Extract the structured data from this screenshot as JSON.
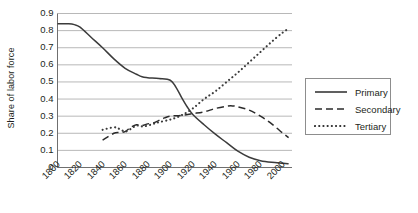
{
  "chart_data": {
    "type": "line",
    "title": "",
    "xlabel": "",
    "ylabel": "Share of labor force",
    "xlim": [
      1800,
      2008
    ],
    "ylim": [
      0,
      0.9
    ],
    "grid": true,
    "legend_position": "right",
    "y_ticks": [
      "0",
      "0.1",
      "0.2",
      "0.3",
      "0.4",
      "0.5",
      "0.6",
      "0.7",
      "0.8",
      "0.9"
    ],
    "y_tick_values": [
      0,
      0.1,
      0.2,
      0.3,
      0.4,
      0.5,
      0.6,
      0.7,
      0.8,
      0.9
    ],
    "x_ticks": [
      "1800",
      "1820",
      "1840",
      "1860",
      "1880",
      "1900",
      "1920",
      "1940",
      "1960",
      "1980",
      "2000"
    ],
    "x_tick_values": [
      1800,
      1820,
      1840,
      1860,
      1880,
      1900,
      1920,
      1940,
      1960,
      1980,
      2000
    ],
    "series": [
      {
        "name": "Primary",
        "style": "solid",
        "color": "#3b3b3b",
        "x": [
          1800,
          1810,
          1815,
          1820,
          1830,
          1840,
          1850,
          1860,
          1870,
          1875,
          1880,
          1890,
          1900,
          1905,
          1910,
          1915,
          1920,
          1930,
          1940,
          1950,
          1960,
          1970,
          1980,
          1990,
          2000,
          2005
        ],
        "values": [
          0.84,
          0.84,
          0.835,
          0.82,
          0.76,
          0.7,
          0.635,
          0.58,
          0.545,
          0.53,
          0.525,
          0.52,
          0.51,
          0.47,
          0.41,
          0.355,
          0.31,
          0.25,
          0.195,
          0.145,
          0.095,
          0.06,
          0.04,
          0.03,
          0.025,
          0.022
        ]
      },
      {
        "name": "Secondary",
        "style": "dashed",
        "color": "#2b2b2b",
        "x": [
          1840,
          1850,
          1855,
          1860,
          1865,
          1870,
          1875,
          1880,
          1885,
          1890,
          1895,
          1900,
          1910,
          1920,
          1930,
          1940,
          1950,
          1955,
          1960,
          1970,
          1980,
          1990,
          2000,
          2005
        ],
        "values": [
          0.16,
          0.2,
          0.205,
          0.21,
          0.235,
          0.25,
          0.245,
          0.255,
          0.26,
          0.275,
          0.29,
          0.3,
          0.305,
          0.315,
          0.325,
          0.345,
          0.358,
          0.36,
          0.355,
          0.335,
          0.3,
          0.255,
          0.2,
          0.175
        ]
      },
      {
        "name": "Tertiary",
        "style": "dotted",
        "color": "#3b3b3b",
        "x": [
          1840,
          1850,
          1855,
          1860,
          1865,
          1870,
          1875,
          1880,
          1885,
          1890,
          1900,
          1910,
          1920,
          1930,
          1940,
          1950,
          1960,
          1970,
          1980,
          1990,
          2000,
          2005
        ],
        "values": [
          0.22,
          0.235,
          0.225,
          0.21,
          0.225,
          0.245,
          0.24,
          0.245,
          0.255,
          0.265,
          0.28,
          0.305,
          0.345,
          0.4,
          0.445,
          0.5,
          0.555,
          0.615,
          0.675,
          0.735,
          0.79,
          0.81
        ]
      }
    ]
  },
  "legend": {
    "items": [
      {
        "label": "Primary",
        "style": "solid"
      },
      {
        "label": "Secondary",
        "style": "dashed"
      },
      {
        "label": "Tertiary",
        "style": "dotted"
      }
    ]
  },
  "colors": {
    "axis": "#6f6f6f",
    "grid": "#a6a6a6",
    "text": "#231f20",
    "legend_border": "#8d8d8d",
    "background": "#ffffff"
  }
}
